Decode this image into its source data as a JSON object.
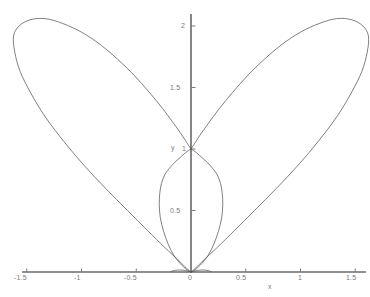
{
  "chart_data": {
    "type": "line",
    "title": "",
    "subtitle": "",
    "xlabel": "x",
    "ylabel": "y",
    "xlim": [
      -1.75,
      1.63
    ],
    "ylim": [
      -0.2,
      2.12
    ],
    "grid": false,
    "legend": null,
    "line_color": "#555555",
    "axis_color": "#222222",
    "tick_color": "#7a7a7a",
    "background": "#ffffff",
    "xticks": [
      -1.5,
      -1,
      -0.5,
      0,
      0.5,
      1,
      1.5
    ],
    "xticklabels": [
      "-1.5",
      "-1",
      "-0.5",
      "0",
      "0.5",
      "1",
      "1.5"
    ],
    "yticks": [
      0.5,
      1,
      1.5,
      2
    ],
    "yticklabels": [
      "0.5",
      "1",
      "1.5",
      "2"
    ],
    "series": [
      {
        "name": "left-outer-petal",
        "points": [
          [
            0,
            0
          ],
          [
            -0.04,
            0.03
          ],
          [
            -0.12,
            0.1
          ],
          [
            -0.24,
            0.2
          ],
          [
            -0.4,
            0.34
          ],
          [
            -0.58,
            0.5
          ],
          [
            -0.78,
            0.68
          ],
          [
            -0.98,
            0.87
          ],
          [
            -1.16,
            1.06
          ],
          [
            -1.33,
            1.26
          ],
          [
            -1.46,
            1.45
          ],
          [
            -1.56,
            1.63
          ],
          [
            -1.61,
            1.79
          ],
          [
            -1.62,
            1.92
          ],
          [
            -1.57,
            2.0
          ],
          [
            -1.47,
            2.05
          ],
          [
            -1.33,
            2.06
          ],
          [
            -1.17,
            2.02
          ],
          [
            -1.0,
            1.95
          ],
          [
            -0.83,
            1.85
          ],
          [
            -0.67,
            1.73
          ],
          [
            -0.52,
            1.6
          ],
          [
            -0.38,
            1.46
          ],
          [
            -0.26,
            1.33
          ],
          [
            -0.16,
            1.21
          ],
          [
            -0.08,
            1.11
          ],
          [
            -0.03,
            1.04
          ],
          [
            0,
            1
          ]
        ]
      },
      {
        "name": "right-outer-petal",
        "points": [
          [
            0,
            0
          ],
          [
            0.04,
            0.03
          ],
          [
            0.12,
            0.1
          ],
          [
            0.24,
            0.2
          ],
          [
            0.4,
            0.34
          ],
          [
            0.58,
            0.5
          ],
          [
            0.78,
            0.68
          ],
          [
            0.98,
            0.87
          ],
          [
            1.16,
            1.06
          ],
          [
            1.33,
            1.26
          ],
          [
            1.46,
            1.45
          ],
          [
            1.56,
            1.63
          ],
          [
            1.61,
            1.79
          ],
          [
            1.62,
            1.92
          ],
          [
            1.57,
            2.0
          ],
          [
            1.47,
            2.05
          ],
          [
            1.33,
            2.06
          ],
          [
            1.17,
            2.02
          ],
          [
            1.0,
            1.95
          ],
          [
            0.83,
            1.85
          ],
          [
            0.67,
            1.73
          ],
          [
            0.52,
            1.6
          ],
          [
            0.38,
            1.46
          ],
          [
            0.26,
            1.33
          ],
          [
            0.16,
            1.21
          ],
          [
            0.08,
            1.11
          ],
          [
            0.03,
            1.04
          ],
          [
            0,
            1
          ]
        ]
      },
      {
        "name": "inner-petal-left",
        "points": [
          [
            0,
            0
          ],
          [
            -0.04,
            0.02
          ],
          [
            -0.1,
            0.07
          ],
          [
            -0.16,
            0.14
          ],
          [
            -0.21,
            0.23
          ],
          [
            -0.25,
            0.33
          ],
          [
            -0.28,
            0.44
          ],
          [
            -0.29,
            0.55
          ],
          [
            -0.285,
            0.64
          ],
          [
            -0.27,
            0.72
          ],
          [
            -0.24,
            0.79
          ],
          [
            -0.2,
            0.84
          ],
          [
            -0.15,
            0.89
          ],
          [
            -0.1,
            0.93
          ],
          [
            -0.05,
            0.97
          ],
          [
            0,
            1
          ]
        ]
      },
      {
        "name": "inner-petal-right",
        "points": [
          [
            0,
            0
          ],
          [
            0.04,
            0.02
          ],
          [
            0.1,
            0.07
          ],
          [
            0.16,
            0.14
          ],
          [
            0.21,
            0.23
          ],
          [
            0.25,
            0.33
          ],
          [
            0.28,
            0.44
          ],
          [
            0.29,
            0.55
          ],
          [
            0.285,
            0.64
          ],
          [
            0.27,
            0.72
          ],
          [
            0.24,
            0.79
          ],
          [
            0.2,
            0.84
          ],
          [
            0.15,
            0.89
          ],
          [
            0.1,
            0.93
          ],
          [
            0.05,
            0.97
          ],
          [
            0,
            1
          ]
        ]
      },
      {
        "name": "origin-tangent-left",
        "points": [
          [
            0,
            0
          ],
          [
            -0.05,
            0.012
          ],
          [
            -0.1,
            0.016
          ],
          [
            -0.14,
            0.014
          ],
          [
            -0.17,
            0.008
          ],
          [
            -0.185,
            0.002
          ]
        ]
      },
      {
        "name": "origin-tangent-right",
        "points": [
          [
            0,
            0
          ],
          [
            0.05,
            0.012
          ],
          [
            0.1,
            0.016
          ],
          [
            0.14,
            0.014
          ],
          [
            0.17,
            0.008
          ],
          [
            0.185,
            0.002
          ]
        ]
      }
    ]
  },
  "axes": {
    "x_axis_name": "x",
    "y_axis_name": "y"
  }
}
